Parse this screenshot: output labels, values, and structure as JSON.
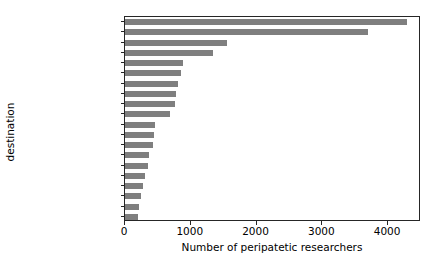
{
  "chart_data": {
    "type": "bar",
    "orientation": "horizontal",
    "title": "",
    "xlabel": "Number of peripatetic researchers",
    "ylabel": "destination",
    "xlim": [
      0,
      4500
    ],
    "ylim": [
      0,
      20
    ],
    "grid": false,
    "legend": null,
    "bar_color": "#7f7f7f",
    "axis_color": "#262626",
    "xticks": [
      0,
      1000,
      2000,
      3000,
      4000
    ],
    "xtick_labels": [
      "0",
      "1000",
      "2000",
      "3000",
      "4000"
    ],
    "categories": [
      "Peoples R China",
      "USA",
      "England",
      "Germany",
      "Australia",
      "South Korea",
      "Japan",
      "France",
      "Canada",
      "Taiwan",
      "Switzerland",
      "Spain",
      "India",
      "Italy",
      "Singapore",
      "Netherlands",
      "Sweden",
      "Scotland",
      "Belgium",
      "Austria"
    ],
    "values": [
      4290,
      3700,
      1545,
      1335,
      880,
      850,
      800,
      780,
      760,
      680,
      460,
      440,
      430,
      360,
      350,
      300,
      270,
      250,
      220,
      195
    ]
  }
}
